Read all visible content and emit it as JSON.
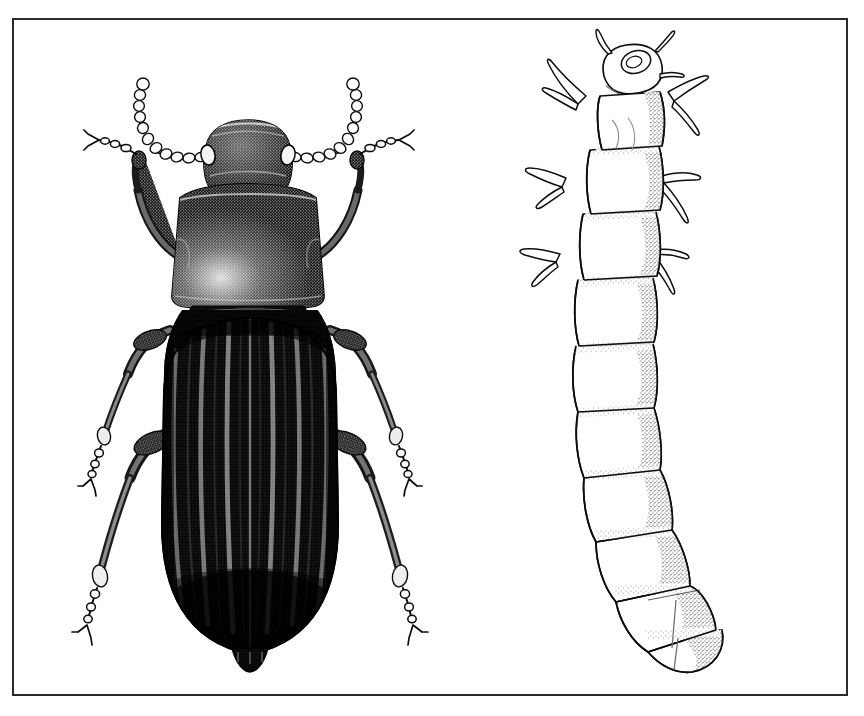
{
  "plate": {
    "background_color": "#ffffff",
    "ink_color": "#000000",
    "frame_color": "#2b2b2b",
    "frame": {
      "x": 12,
      "y": 18,
      "width": 836,
      "height": 678,
      "border_width": 2
    },
    "medium": "stipple and line pen-and-ink scientific illustration",
    "style": "black-and-white entomological plate"
  },
  "figures": [
    {
      "id": "adult-beetle",
      "label": "adult darkling beetle, dorsal view",
      "common_name": "mealworm beetle",
      "family": "Tenebrionidae",
      "position": {
        "center_x": 250,
        "center_y": 370
      },
      "bounds": {
        "x": 62,
        "y": 55,
        "width": 380,
        "height": 615
      },
      "orientation": "head up, dorsal aspect",
      "tone": "very dark, near-solid black with white highlight striations",
      "parts": {
        "head": {
          "shape": "rounded trapezoid, narrower than pronotum",
          "center_x": 248,
          "center_y": 155,
          "width": 96,
          "height": 72,
          "features": [
            "clypeus",
            "compound eyes at lateral notches",
            "coarse stipple"
          ]
        },
        "eyes": {
          "count": 2,
          "position": "lateral at antennal insertions"
        },
        "antennae": {
          "count": 2,
          "type": "moniliform (beaded)",
          "segments_each": 11,
          "description": "arcs sweeping outward and upward from behind the eyes, beads enlarging distally"
        },
        "pronotum": {
          "shape": "broad trapezoid, widest at middle, posterior angles squared",
          "center_x": 248,
          "center_y": 243,
          "width": 152,
          "height": 120,
          "shading": "dense stipple with pale highlight at lower-left quadrant"
        },
        "scutellum": {
          "shape": "small triangular plate between elytral bases"
        },
        "elytra": {
          "count": 2,
          "shape": "elongate oval, parallel-sided then rounded at apex",
          "center_x": 250,
          "center_y": 465,
          "width": 176,
          "height": 370,
          "striae_per_elytron": 8,
          "description": "longitudinal punctate striae rendered as alternating white and black ribs, darkest toward apex and lateral margins",
          "sutural_line": "fine pale midline running full length"
        },
        "abdomen_tip": {
          "description": "small exposed pygidium visible beyond elytral apex"
        },
        "legs": {
          "count": 6,
          "pairs": [
            "prothoracic",
            "mesothoracic",
            "metathoracic"
          ],
          "segments": [
            "coxa",
            "femur",
            "tibia",
            "tarsus",
            "claws"
          ],
          "description": "femora stout and stippled, tibiae slender, tarsi beaded with terminal bifid claws"
        }
      }
    },
    {
      "id": "larva",
      "label": "larva, dorsal view",
      "common_name": "mealworm",
      "position": {
        "center_x": 630,
        "center_y": 370
      },
      "bounds": {
        "x": 512,
        "y": 40,
        "width": 245,
        "height": 640
      },
      "orientation": "head upper right, body curving down and to the right",
      "tone": "pale, outline drawing with fine stipple shading along segment margins",
      "parts": {
        "head_capsule": {
          "center_x": 625,
          "center_y": 70,
          "description": "small sclerotized capsule with mandibles and short antennae"
        },
        "thoracic_segments": {
          "count": 3,
          "bears_legs": true
        },
        "abdominal_segments": {
          "count": 9
        },
        "total_visible_segments": 13,
        "legs": {
          "count": 6,
          "placement": "three pairs on thoracic segments near the head",
          "description": "short, tapering, clawed, projecting laterally"
        },
        "terminal_segment": {
          "description": "rounded caudal segment, stippled, with faint median and transverse creases"
        },
        "segment_shading": "stipple concentrated on segment overlaps and the right (lower) margin suggesting cylindrical volume"
      }
    }
  ],
  "composition": {
    "figure_count": 2,
    "arrangement": "two figures side by side within a single ruled rectangular frame",
    "left_figure": "adult-beetle",
    "right_figure": "larva",
    "caption": "",
    "scale_bar": false,
    "labels_present": false
  }
}
